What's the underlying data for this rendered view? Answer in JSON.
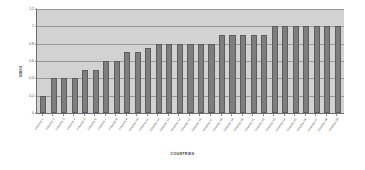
{
  "chart_data": {
    "type": "bar",
    "title": "",
    "xlabel": "COUNTRIES",
    "ylabel": "INDEX",
    "ylim": [
      0,
      1.2
    ],
    "ytick_labels": [
      "1.2",
      "1",
      "0.8",
      "0.6",
      "0.4",
      "0.2",
      "0"
    ],
    "ytick_values": [
      1.2,
      1.0,
      0.8,
      0.6,
      0.4,
      0.2,
      0
    ],
    "grid": true,
    "legend": "none",
    "bar_color": "#7e7e7e",
    "plot_background": "#d2d2d2",
    "categories": [
      "Country 1",
      "Country 2",
      "Country 3",
      "Country 4",
      "Country 5",
      "Country 6",
      "Country 7",
      "Country 8",
      "Country 9",
      "Country 10",
      "Country 11",
      "Country 12",
      "Country 13",
      "Country 14",
      "Country 15",
      "Country 16",
      "Country 17",
      "Country 18",
      "Country 19",
      "Country 20",
      "Country 21",
      "Country 22",
      "Country 23",
      "Country 24",
      "Country 25",
      "Country 26",
      "Country 27",
      "Country 28",
      "Country 29"
    ],
    "values": [
      0.2,
      0.4,
      0.4,
      0.4,
      0.5,
      0.5,
      0.6,
      0.6,
      0.7,
      0.7,
      0.75,
      0.8,
      0.8,
      0.8,
      0.8,
      0.8,
      0.8,
      0.9,
      0.9,
      0.9,
      0.9,
      0.9,
      1.0,
      1.0,
      1.0,
      1.0,
      1.0,
      1.0,
      1.0
    ]
  }
}
